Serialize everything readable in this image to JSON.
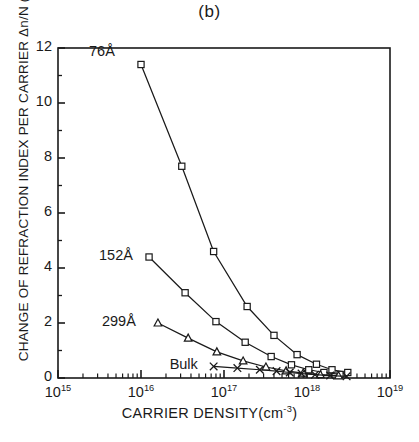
{
  "figure": {
    "panel_title": "(b)",
    "ylabel_text": "CHANGE OF REFRACTION INDEX PER CARRIER",
    "ylabel_symbol": "Δn/N (x10",
    "ylabel_exp": "19",
    "ylabel_tail": ") cm",
    "ylabel_tail_exp": "3",
    "xlabel_text": "CARRIER DENSITY(cm",
    "xlabel_exp": "-3",
    "xlabel_tail": ")"
  },
  "chart_data": {
    "type": "line",
    "title": "(b)",
    "xlabel": "CARRIER DENSITY(cm^-3)",
    "ylabel": "CHANGE OF REFRACTION INDEX PER CARRIER Δn/N (x10^19) cm^3",
    "xscale": "log",
    "yscale": "linear",
    "xlim": [
      1000000000000000.0,
      1e+19
    ],
    "ylim": [
      0,
      12
    ],
    "grid": false,
    "legend": "inline-annotations",
    "ytick_labels": [
      "0",
      "2",
      "4",
      "6",
      "8",
      "10",
      "12"
    ],
    "ytick_values": [
      0,
      2,
      4,
      6,
      8,
      10,
      12
    ],
    "yminor_step": 1,
    "xtick_labels": [
      "10^15",
      "10^16",
      "10^17",
      "10^18",
      "10^19"
    ],
    "xtick_mantissa": [
      "10",
      "10",
      "10",
      "10",
      "10"
    ],
    "xtick_exponents": [
      "15",
      "16",
      "17",
      "18",
      "19"
    ],
    "xtick_values": [
      1000000000000000.0,
      1e+16,
      1e+17,
      1e+18,
      1e+19
    ],
    "series": [
      {
        "name": "76A",
        "label": "76Å",
        "marker": "square",
        "points": [
          {
            "x": 1e+16,
            "y": 11.4
          },
          {
            "x": 3.1e+16,
            "y": 7.7
          },
          {
            "x": 7.5e+16,
            "y": 4.6
          },
          {
            "x": 1.9e+17,
            "y": 2.6
          },
          {
            "x": 4e+17,
            "y": 1.55
          },
          {
            "x": 7.6e+17,
            "y": 0.85
          },
          {
            "x": 1.3e+18,
            "y": 0.5
          },
          {
            "x": 2e+18,
            "y": 0.3
          },
          {
            "x": 3.1e+18,
            "y": 0.2
          }
        ]
      },
      {
        "name": "152A",
        "label": "152Å",
        "marker": "square",
        "points": [
          {
            "x": 1.25e+16,
            "y": 4.4
          },
          {
            "x": 3.4e+16,
            "y": 3.1
          },
          {
            "x": 8e+16,
            "y": 2.05
          },
          {
            "x": 1.8e+17,
            "y": 1.3
          },
          {
            "x": 3.7e+17,
            "y": 0.78
          },
          {
            "x": 6.5e+17,
            "y": 0.48
          },
          {
            "x": 1.05e+18,
            "y": 0.3
          },
          {
            "x": 1.6e+18,
            "y": 0.2
          },
          {
            "x": 2.5e+18,
            "y": 0.13
          }
        ]
      },
      {
        "name": "299A",
        "label": "299Å",
        "marker": "triangle",
        "points": [
          {
            "x": 1.6e+16,
            "y": 2.0
          },
          {
            "x": 3.7e+16,
            "y": 1.45
          },
          {
            "x": 8.2e+16,
            "y": 0.95
          },
          {
            "x": 1.7e+17,
            "y": 0.62
          },
          {
            "x": 3.2e+17,
            "y": 0.4
          },
          {
            "x": 5.6e+17,
            "y": 0.26
          },
          {
            "x": 9e+17,
            "y": 0.18
          },
          {
            "x": 1.45e+18,
            "y": 0.12
          },
          {
            "x": 2.4e+18,
            "y": 0.08
          }
        ]
      },
      {
        "name": "Bulk",
        "label": "Bulk",
        "marker": "cross",
        "points": [
          {
            "x": 7.5e+16,
            "y": 0.42
          },
          {
            "x": 1.45e+17,
            "y": 0.36
          },
          {
            "x": 2.7e+17,
            "y": 0.3
          },
          {
            "x": 4.3e+17,
            "y": 0.25
          },
          {
            "x": 6.2e+17,
            "y": 0.2
          },
          {
            "x": 8.6e+17,
            "y": 0.16
          },
          {
            "x": 1.25e+18,
            "y": 0.12
          },
          {
            "x": 1.9e+18,
            "y": 0.09
          },
          {
            "x": 3e+18,
            "y": 0.06
          }
        ]
      }
    ],
    "annotations": [
      {
        "text": "76Å",
        "series": "76A"
      },
      {
        "text": "152Å",
        "series": "152A"
      },
      {
        "text": "299Å",
        "series": "299A"
      },
      {
        "text": "Bulk",
        "series": "Bulk"
      }
    ]
  }
}
